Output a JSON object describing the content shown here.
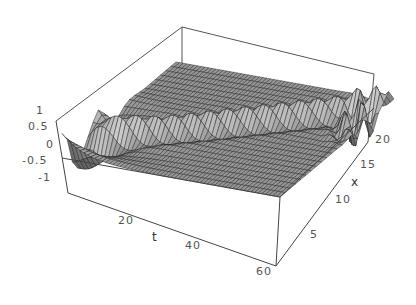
{
  "chart_data": {
    "type": "surface3d",
    "title": "",
    "xlabel": "t",
    "ylabel": "x",
    "zlabel": "",
    "t_ticks": [
      "20",
      "40",
      "60"
    ],
    "x_ticks": [
      "5",
      "10",
      "15",
      "20"
    ],
    "z_ticks": [
      "1",
      "0.5",
      "0",
      "-0.5",
      "-1"
    ],
    "t_range": [
      0,
      60
    ],
    "x_range": [
      0,
      22
    ],
    "z_range": [
      -1,
      1
    ],
    "mesh_color": "#9a9a9a",
    "line_color": "#1a1a1a"
  },
  "ticks": {
    "z": [
      {
        "label": "1",
        "x": 36,
        "y": 112
      },
      {
        "label": "0.5",
        "x": 28,
        "y": 128
      },
      {
        "label": "0",
        "x": 46,
        "y": 146
      },
      {
        "label": "-0.5",
        "x": 22,
        "y": 162
      },
      {
        "label": "-1",
        "x": 38,
        "y": 179
      }
    ],
    "t": [
      {
        "label": "20",
        "x": 118,
        "y": 222
      },
      {
        "label": "40",
        "x": 185,
        "y": 247
      },
      {
        "label": "60",
        "x": 256,
        "y": 273
      }
    ],
    "x": [
      {
        "label": "5",
        "x": 310,
        "y": 236
      },
      {
        "label": "10",
        "x": 335,
        "y": 201
      },
      {
        "label": "15",
        "x": 360,
        "y": 166
      },
      {
        "label": "20",
        "x": 375,
        "y": 141
      }
    ]
  },
  "labels": {
    "t": {
      "text": "t",
      "x": 152,
      "y": 238
    },
    "x": {
      "text": "x",
      "x": 351,
      "y": 183
    }
  }
}
